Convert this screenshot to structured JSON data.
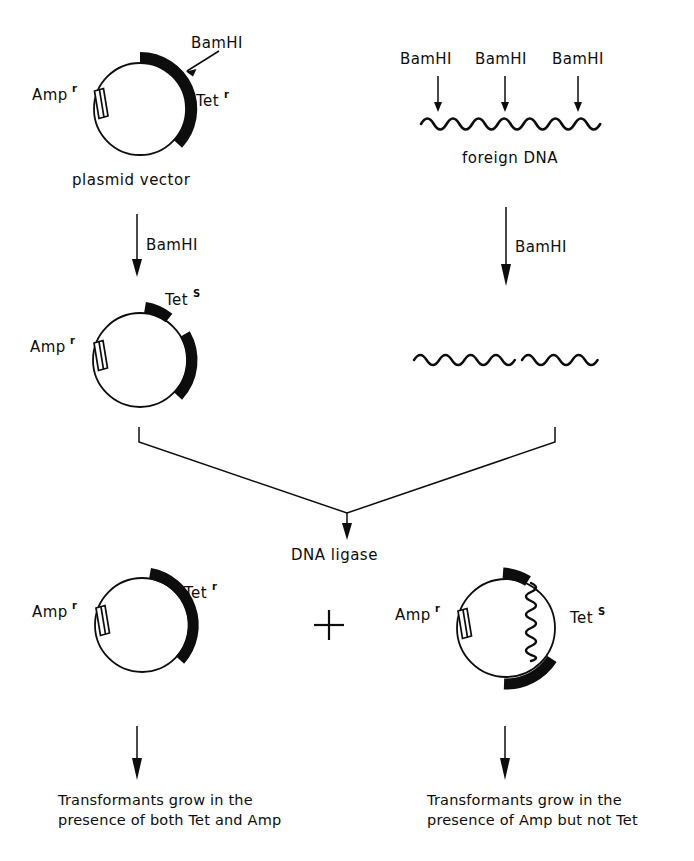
{
  "figure": {
    "ink_color": "#0d0d0d",
    "background_color": "#ffffff"
  },
  "enzymes": {
    "restriction": "BamHI",
    "ligase": "DNA ligase"
  },
  "markers": {
    "amp": "Amp",
    "amp_sup_resistant": "r",
    "tet": "Tet",
    "tet_sup_resistant": "r",
    "tet_sup_sensitive": "S"
  },
  "step1": {
    "left": {
      "cut_site_label": "BamHI",
      "amp_label": "Amp",
      "amp_sup": "r",
      "tet_label": "Tet",
      "tet_sup": "r",
      "caption": "plasmid vector"
    },
    "right": {
      "cut_site_labels": [
        "BamHI",
        "BamHI",
        "BamHI"
      ],
      "caption": "foreign DNA"
    }
  },
  "step2": {
    "left_arrow_label": "BamHI",
    "right_arrow_label": "BamHI",
    "cut_plasmid": {
      "amp_label": "Amp",
      "amp_sup": "r",
      "tet_label": "Tet",
      "tet_sup": "S"
    },
    "fragments_count": 2
  },
  "step3": {
    "arrow_label": "DNA ligase"
  },
  "step4": {
    "operator": "+",
    "left_product": {
      "amp_label": "Amp",
      "amp_sup": "r",
      "tet_label": "Tet",
      "tet_sup": "r",
      "outcome_line1": "Transformants grow in the",
      "outcome_line2": "presence of both Tet and Amp"
    },
    "right_product": {
      "amp_label": "Amp",
      "amp_sup": "r",
      "tet_label": "Tet",
      "tet_sup": "S",
      "outcome_line1": "Transformants grow in the",
      "outcome_line2": "presence of Amp but not Tet"
    }
  }
}
